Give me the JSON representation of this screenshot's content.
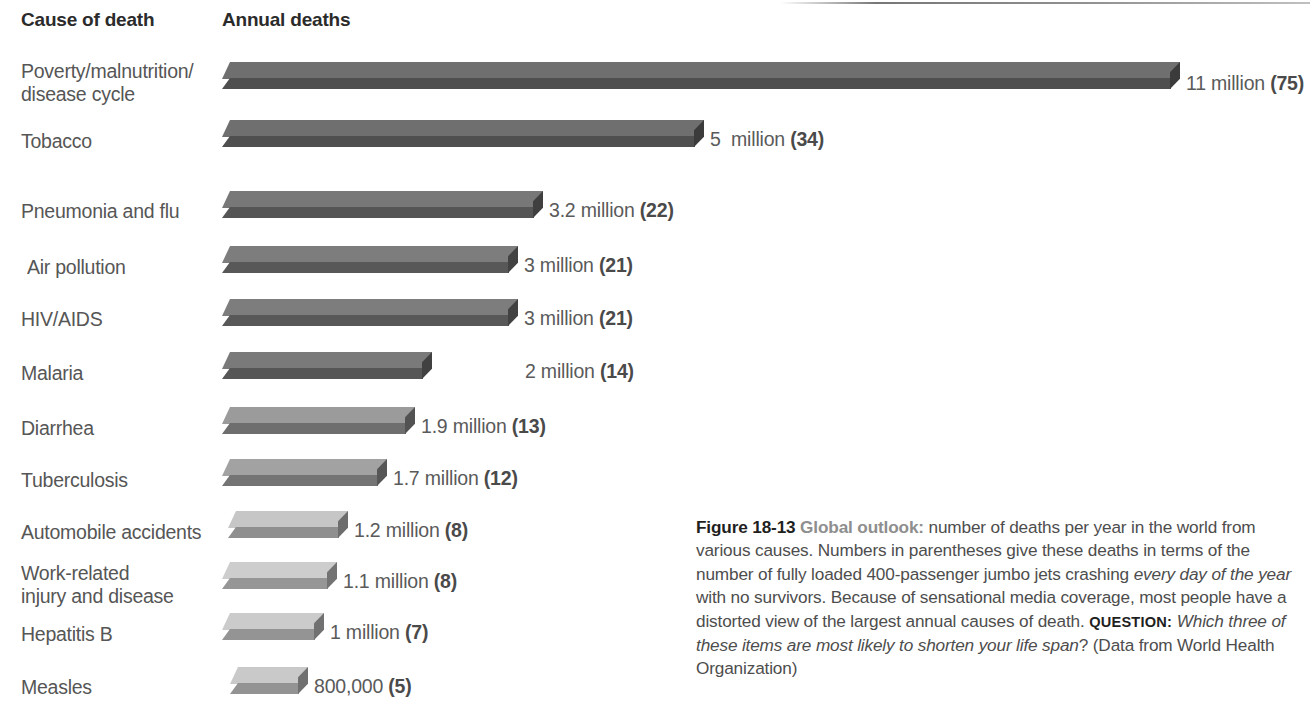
{
  "figure": {
    "headers": {
      "cause": "Cause of death",
      "deaths": "Annual deaths"
    },
    "caption": {
      "figure_number": "Figure 18-13",
      "lead_in": "Global outlook:",
      "text_1": " number of deaths per year in the world from various causes. Numbers in parentheses give these deaths in terms of the number of fully loaded 400-passenger jumbo jets crashing ",
      "italic_1": "every day of the year",
      "text_2": " with no survivors. Because of sensational media coverage, most people have a distorted view of the largest annual causes of death. ",
      "question_label": "QUESTION:",
      "italic_2": " Which three of these items are most likely to shorten your life span",
      "text_3": "? (Data from World Health Organization)"
    }
  },
  "chart_data": {
    "type": "bar",
    "title": "Figure 18-13 Global outlook: number of deaths per year in the world from various causes",
    "orientation": "horizontal",
    "xlabel": "Annual deaths",
    "ylabel": "Cause of death",
    "categories": [
      "Poverty/malnutrition/\ndisease cycle",
      "Tobacco",
      "Pneumonia and flu",
      "Air pollution",
      "HIV/AIDS",
      "Malaria",
      "Diarrhea",
      "Tuberculosis",
      "Automobile accidents",
      "Work-related\ninjury and disease",
      "Hepatitis B",
      "Measles"
    ],
    "values": [
      11000000,
      5000000,
      3200000,
      3000000,
      3000000,
      2000000,
      1900000,
      1700000,
      1200000,
      1100000,
      1000000,
      800000
    ],
    "value_labels": [
      "11 million ",
      "5  million ",
      "3.2 million ",
      "3 million ",
      "3 million ",
      "2 million ",
      "1.9 million ",
      "1.7 million ",
      "1.2 million ",
      "1.1 million ",
      "1 million ",
      "800,000 "
    ],
    "jet_equivalents": [
      "(75)",
      "(34)",
      "(22)",
      "(21)",
      "(21)",
      "(14)",
      "(13)",
      "(12)",
      "(8)",
      "(8)",
      "(7)",
      "(5)"
    ],
    "bar_colors_top": [
      "#6f6f6f",
      "#6f6f6f",
      "#787878",
      "#7d7d7d",
      "#7d7d7d",
      "#7a7a7a",
      "#9b9b9b",
      "#a2a2a2",
      "#c6c6c6",
      "#cdcdcd",
      "#cbcbcb",
      "#c9c9c9"
    ],
    "bar_colors_front": [
      "#4f4f4f",
      "#4f4f4f",
      "#555555",
      "#585858",
      "#585858",
      "#565656",
      "#6e6e6e",
      "#747474",
      "#8f8f8f",
      "#969696",
      "#949494",
      "#939393"
    ],
    "bar_colors_side": [
      "#3b3b3b",
      "#3b3b3b",
      "#3f3f3f",
      "#424242",
      "#424242",
      "#414141",
      "#525252",
      "#565656",
      "#6d6d6d",
      "#737373",
      "#717171",
      "#707070"
    ],
    "ylim": [
      0,
      11000000
    ],
    "grid": false,
    "legend": "none",
    "source": "Data from World Health Organization",
    "rows": [
      {
        "label": "Poverty/malnutrition/\ndisease cycle",
        "value_label": "11 million ",
        "jets": "(75)",
        "label_top": 60,
        "bar_top": 62,
        "bar_left": 222,
        "bar_width": 958,
        "value_left": 1186,
        "value_top": 72
      },
      {
        "label": "Tobacco",
        "value_label": "5  million ",
        "jets": "(34)",
        "label_top": 130,
        "bar_top": 120,
        "bar_left": 222,
        "bar_width": 482,
        "value_left": 710,
        "value_top": 128
      },
      {
        "label": "Pneumonia and flu",
        "value_label": "3.2 million ",
        "jets": "(22)",
        "label_top": 200,
        "bar_top": 191,
        "bar_left": 222,
        "bar_width": 321,
        "value_left": 549,
        "value_top": 199
      },
      {
        "label": "Air pollution",
        "value_label": "3 million ",
        "jets": "(21)",
        "label_top": 256,
        "bar_top": 246,
        "bar_left": 222,
        "bar_width": 296,
        "value_left": 524,
        "value_top": 254
      },
      {
        "label": "HIV/AIDS",
        "value_label": "3 million ",
        "jets": "(21)",
        "label_top": 308,
        "bar_top": 299,
        "bar_left": 222,
        "bar_width": 296,
        "value_left": 524,
        "value_top": 307
      },
      {
        "label": "Malaria",
        "value_label": "2 million ",
        "jets": "(14)",
        "label_top": 362,
        "bar_top": 352,
        "bar_left": 222,
        "bar_width": 210,
        "value_left": 525,
        "value_top": 360
      },
      {
        "label": "Diarrhea",
        "value_label": "1.9 million ",
        "jets": "(13)",
        "label_top": 417,
        "bar_top": 407,
        "bar_left": 222,
        "bar_width": 193,
        "value_left": 421,
        "value_top": 415
      },
      {
        "label": "Tuberculosis",
        "value_label": "1.7 million ",
        "jets": "(12)",
        "label_top": 469,
        "bar_top": 459,
        "bar_left": 222,
        "bar_width": 165,
        "value_left": 393,
        "value_top": 467
      },
      {
        "label": "Automobile accidents",
        "value_label": "1.2 million ",
        "jets": "(8)",
        "label_top": 521,
        "bar_top": 511,
        "bar_left": 228,
        "bar_width": 120,
        "value_left": 354,
        "value_top": 519
      },
      {
        "label": "Work-related\ninjury and disease",
        "value_label": "1.1 million ",
        "jets": "(8)",
        "label_top": 562,
        "bar_top": 562,
        "bar_left": 222,
        "bar_width": 115,
        "value_left": 343,
        "value_top": 570
      },
      {
        "label": "Hepatitis B",
        "value_label": "1 million ",
        "jets": "(7)",
        "label_top": 623,
        "bar_top": 613,
        "bar_left": 222,
        "bar_width": 102,
        "value_left": 330,
        "value_top": 621
      },
      {
        "label": "Measles",
        "value_label": "800,000 ",
        "jets": "(5)",
        "label_top": 676,
        "bar_top": 667,
        "bar_left": 230,
        "bar_width": 78,
        "value_left": 314,
        "value_top": 675
      }
    ],
    "row_label_left": [
      21,
      21,
      21,
      27,
      21,
      21,
      21,
      21,
      21,
      21,
      21,
      21
    ]
  }
}
